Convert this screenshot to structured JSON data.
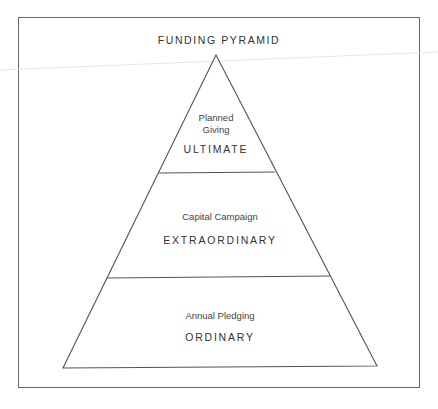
{
  "title": "FUNDING PYRAMID",
  "tiers": [
    {
      "name_line1": "Planned",
      "name_line2": "Giving",
      "level": "ULTIMATE"
    },
    {
      "name": "Capital Campaign",
      "level": "EXTRAORDINARY"
    },
    {
      "name": "Annual Pledging",
      "level": "ORDINARY"
    }
  ],
  "colors": {
    "line": "#555555",
    "frame": "#666666",
    "text": "#333333"
  }
}
